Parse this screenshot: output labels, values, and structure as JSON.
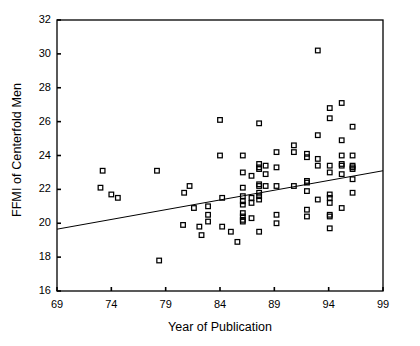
{
  "chart_data": {
    "type": "scatter",
    "title": "",
    "xlabel": "Year of Publication",
    "ylabel": "FFMI of Centerfold Men",
    "xlim": [
      69,
      99
    ],
    "ylim": [
      16,
      32
    ],
    "xticks": [
      69,
      74,
      79,
      84,
      89,
      94,
      99
    ],
    "yticks": [
      16,
      18,
      20,
      22,
      24,
      26,
      28,
      30,
      32
    ],
    "grid": false,
    "legend": null,
    "marker": "open-square",
    "marker_color": "#000000",
    "series": [
      {
        "name": "Centerfold men",
        "points": [
          [
            73.0,
            22.1
          ],
          [
            74.0,
            21.7
          ],
          [
            74.6,
            21.5
          ],
          [
            73.2,
            23.1
          ],
          [
            78.2,
            23.1
          ],
          [
            78.4,
            17.8
          ],
          [
            80.7,
            21.8
          ],
          [
            80.6,
            19.9
          ],
          [
            81.2,
            22.2
          ],
          [
            81.6,
            20.9
          ],
          [
            82.1,
            19.8
          ],
          [
            82.3,
            19.3
          ],
          [
            82.9,
            21.0
          ],
          [
            82.9,
            20.5
          ],
          [
            82.9,
            20.1
          ],
          [
            84.0,
            26.1
          ],
          [
            84.0,
            24.0
          ],
          [
            84.2,
            21.5
          ],
          [
            84.2,
            19.8
          ],
          [
            85.0,
            19.5
          ],
          [
            85.6,
            18.9
          ],
          [
            86.1,
            24.0
          ],
          [
            86.1,
            23.0
          ],
          [
            86.1,
            22.1
          ],
          [
            86.1,
            21.6
          ],
          [
            86.1,
            21.3
          ],
          [
            86.1,
            21.1
          ],
          [
            86.1,
            20.6
          ],
          [
            86.1,
            20.4
          ],
          [
            86.1,
            20.2
          ],
          [
            86.1,
            20.1
          ],
          [
            86.9,
            22.8
          ],
          [
            86.9,
            21.5
          ],
          [
            86.9,
            21.2
          ],
          [
            86.9,
            20.3
          ],
          [
            87.6,
            25.9
          ],
          [
            87.6,
            23.5
          ],
          [
            87.6,
            23.3
          ],
          [
            87.6,
            23.2
          ],
          [
            87.6,
            22.3
          ],
          [
            87.6,
            22.2
          ],
          [
            87.6,
            21.8
          ],
          [
            87.6,
            21.6
          ],
          [
            87.6,
            21.4
          ],
          [
            87.6,
            19.5
          ],
          [
            88.2,
            23.4
          ],
          [
            88.2,
            22.9
          ],
          [
            88.2,
            22.2
          ],
          [
            89.2,
            24.2
          ],
          [
            89.2,
            23.3
          ],
          [
            89.2,
            22.2
          ],
          [
            89.2,
            20.5
          ],
          [
            89.2,
            20.0
          ],
          [
            90.8,
            24.6
          ],
          [
            90.8,
            24.2
          ],
          [
            90.8,
            22.2
          ],
          [
            92.0,
            24.1
          ],
          [
            92.0,
            23.9
          ],
          [
            92.0,
            22.5
          ],
          [
            92.0,
            22.4
          ],
          [
            92.0,
            21.9
          ],
          [
            92.0,
            20.8
          ],
          [
            92.0,
            20.4
          ],
          [
            93.0,
            30.2
          ],
          [
            93.0,
            25.2
          ],
          [
            93.0,
            23.8
          ],
          [
            93.0,
            23.4
          ],
          [
            93.0,
            21.4
          ],
          [
            94.1,
            26.8
          ],
          [
            94.1,
            26.2
          ],
          [
            94.1,
            23.4
          ],
          [
            94.1,
            23.0
          ],
          [
            94.1,
            21.7
          ],
          [
            94.1,
            21.5
          ],
          [
            94.1,
            21.2
          ],
          [
            94.1,
            20.5
          ],
          [
            94.1,
            20.4
          ],
          [
            94.1,
            19.7
          ],
          [
            95.2,
            27.1
          ],
          [
            95.2,
            24.9
          ],
          [
            95.2,
            24.0
          ],
          [
            95.2,
            23.5
          ],
          [
            95.2,
            23.4
          ],
          [
            95.2,
            22.9
          ],
          [
            95.2,
            20.9
          ],
          [
            96.2,
            25.7
          ],
          [
            96.2,
            24.0
          ],
          [
            96.2,
            23.4
          ],
          [
            96.2,
            23.3
          ],
          [
            96.2,
            23.2
          ],
          [
            96.2,
            22.6
          ],
          [
            96.2,
            21.8
          ]
        ]
      }
    ],
    "trendline": {
      "name": "linear regression",
      "x_start": 69,
      "y_start": 19.65,
      "x_end": 99,
      "y_end": 23.1,
      "color": "#000000"
    }
  }
}
